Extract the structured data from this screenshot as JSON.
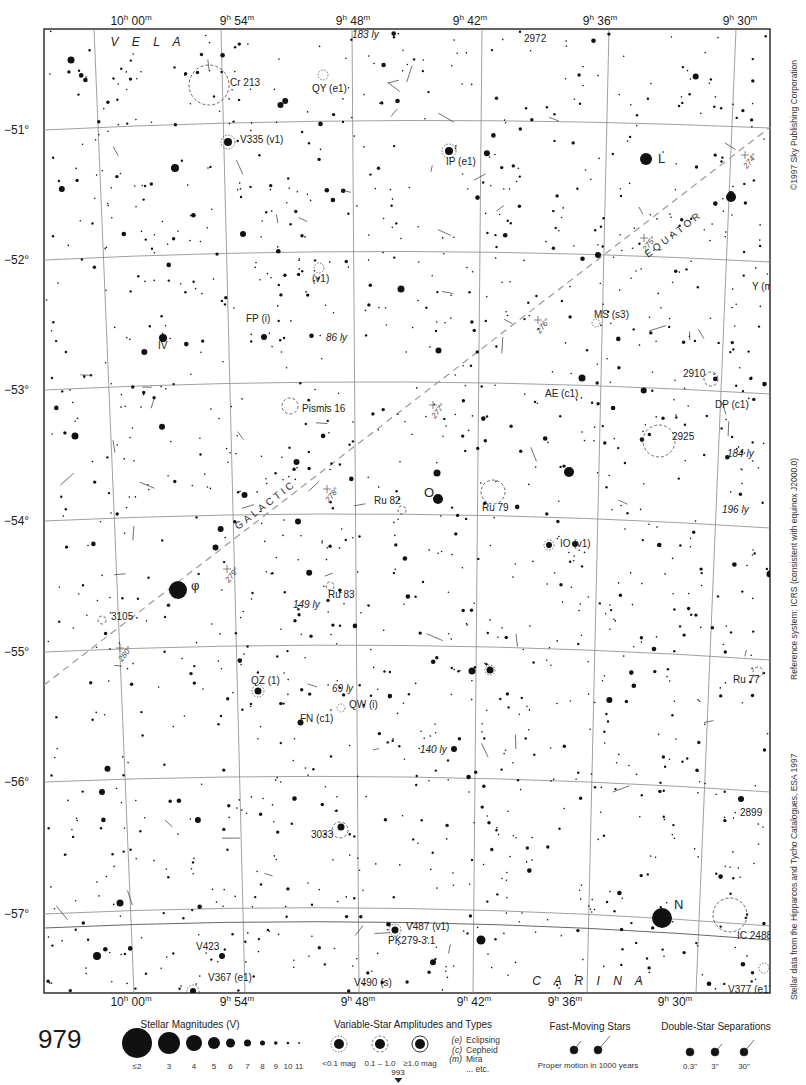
{
  "chart_page": {
    "page_number": "979",
    "adjacent_page_below": "993",
    "copyright": "©1997 Sky Publishing Corporation",
    "reference_system": "Reference system: ICRS (consistent with equinox J2000.0)",
    "data_source": "Stellar data from the Hipparcos and Tycho Catalogues, ESA 1997"
  },
  "axes": {
    "ra_labels": [
      {
        "text": "10h 00m",
        "x_top": 131,
        "x_bot": 131
      },
      {
        "text": "9h 54m",
        "x_top": 237,
        "x_bot": 237
      },
      {
        "text": "9h 48m",
        "x_top": 353,
        "x_bot": 358
      },
      {
        "text": "9h 42m",
        "x_top": 470,
        "x_bot": 474
      },
      {
        "text": "9h 36m",
        "x_top": 600,
        "x_bot": 565
      },
      {
        "text": "9h 30m",
        "x_top": 740,
        "x_bot": 675
      }
    ],
    "dec_labels": [
      {
        "text": "−51°",
        "y": 130
      },
      {
        "text": "−52°",
        "y": 260
      },
      {
        "text": "−53°",
        "y": 390
      },
      {
        "text": "−54°",
        "y": 521
      },
      {
        "text": "−55°",
        "y": 652
      },
      {
        "text": "−56°",
        "y": 782
      },
      {
        "text": "−57°",
        "y": 914
      }
    ]
  },
  "constellations": [
    {
      "name": "V E L A",
      "x": 148,
      "y": 46
    },
    {
      "name": "C A R I N A",
      "x": 590,
      "y": 985
    }
  ],
  "galactic_equator": {
    "label_equator": "EQUATOR",
    "label_galactic": "GALACTIC",
    "ticks": [
      {
        "lon": "274°",
        "x": 745,
        "y": 155
      },
      {
        "lon": "275°",
        "x": 644,
        "y": 238
      },
      {
        "lon": "276°",
        "x": 538,
        "y": 320
      },
      {
        "lon": "277°",
        "x": 433,
        "y": 405
      },
      {
        "lon": "278°",
        "x": 327,
        "y": 489
      },
      {
        "lon": "279°",
        "x": 227,
        "y": 569
      },
      {
        "lon": "280°",
        "x": 120,
        "y": 648
      }
    ]
  },
  "labels": [
    {
      "text": "183 ly",
      "x": 352,
      "y": 38,
      "italic": true
    },
    {
      "text": "2972",
      "x": 524,
      "y": 42
    },
    {
      "text": "Cr 213",
      "x": 230,
      "y": 86
    },
    {
      "text": "QY (e1)",
      "x": 312,
      "y": 92
    },
    {
      "text": "V335 (v1)",
      "x": 240,
      "y": 143
    },
    {
      "text": "IP (e1)",
      "x": 446,
      "y": 165
    },
    {
      "text": "L",
      "x": 658,
      "y": 163
    },
    {
      "text": "(v1)",
      "x": 312,
      "y": 282
    },
    {
      "text": "Y (m3)",
      "x": 752,
      "y": 290
    },
    {
      "text": "FP (i)",
      "x": 246,
      "y": 322
    },
    {
      "text": "MS (s3)",
      "x": 594,
      "y": 318
    },
    {
      "text": "86 ly",
      "x": 326,
      "y": 341,
      "italic": true
    },
    {
      "text": "IV",
      "x": 158,
      "y": 349
    },
    {
      "text": "2910",
      "x": 683,
      "y": 377
    },
    {
      "text": "AE (c1)",
      "x": 545,
      "y": 397
    },
    {
      "text": "Pismis 16",
      "x": 302,
      "y": 412
    },
    {
      "text": "DP (c1)",
      "x": 715,
      "y": 408
    },
    {
      "text": "2925",
      "x": 672,
      "y": 440
    },
    {
      "text": "184 ly",
      "x": 727,
      "y": 457,
      "italic": true
    },
    {
      "text": "O",
      "x": 424,
      "y": 497
    },
    {
      "text": "Ru 82",
      "x": 374,
      "y": 504
    },
    {
      "text": "Ru 79",
      "x": 482,
      "y": 511
    },
    {
      "text": "196 ly",
      "x": 722,
      "y": 513,
      "italic": true
    },
    {
      "text": "IO (v1)",
      "x": 560,
      "y": 547
    },
    {
      "text": "φ",
      "x": 191,
      "y": 590
    },
    {
      "text": "Ru 83",
      "x": 328,
      "y": 598
    },
    {
      "text": "149 ly",
      "x": 293,
      "y": 608,
      "italic": true
    },
    {
      "text": "3105",
      "x": 111,
      "y": 620
    },
    {
      "text": "Ru 77",
      "x": 733,
      "y": 683
    },
    {
      "text": "QZ (1)",
      "x": 251,
      "y": 684
    },
    {
      "text": "69 ly",
      "x": 332,
      "y": 692,
      "italic": true
    },
    {
      "text": "QW (i)",
      "x": 349,
      "y": 708
    },
    {
      "text": "FN (c1)",
      "x": 300,
      "y": 722
    },
    {
      "text": "140 ly",
      "x": 420,
      "y": 753,
      "italic": true
    },
    {
      "text": "2899",
      "x": 740,
      "y": 816
    },
    {
      "text": "3033",
      "x": 311,
      "y": 838
    },
    {
      "text": "N",
      "x": 674,
      "y": 909
    },
    {
      "text": "IC 2488",
      "x": 737,
      "y": 939
    },
    {
      "text": "V487 (v1)",
      "x": 406,
      "y": 930
    },
    {
      "text": "PK279-3.1",
      "x": 388,
      "y": 944
    },
    {
      "text": "V423",
      "x": 196,
      "y": 950
    },
    {
      "text": "V367 (e1)",
      "x": 208,
      "y": 981
    },
    {
      "text": "V490 (s)",
      "x": 354,
      "y": 986
    },
    {
      "text": "V377 (e1)",
      "x": 728,
      "y": 993
    }
  ],
  "legend": {
    "magnitudes": {
      "title": "Stellar Magnitudes (V)",
      "items": [
        {
          "label": "≤2",
          "r": 15
        },
        {
          "label": "3",
          "r": 11
        },
        {
          "label": "4",
          "r": 8
        },
        {
          "label": "5",
          "r": 6
        },
        {
          "label": "6",
          "r": 4.5
        },
        {
          "label": "7",
          "r": 3.5
        },
        {
          "label": "8",
          "r": 2.5
        },
        {
          "label": "9",
          "r": 1.8
        },
        {
          "label": "10",
          "r": 1.3
        },
        {
          "label": "11",
          "r": 0.9
        }
      ]
    },
    "variables": {
      "title": "Variable-Star Amplitudes and Types",
      "amplitudes": [
        "<0.1 mag",
        "0.1 – 1.0",
        "≥1.0 mag"
      ],
      "types": [
        {
          "code": "(e)",
          "name": "Eclipsing"
        },
        {
          "code": "(c)",
          "name": "Cepheid"
        },
        {
          "code": "(m)",
          "name": "Mira"
        },
        {
          "code": "",
          "name": "... etc."
        }
      ]
    },
    "fast_moving": {
      "title": "Fast-Moving Stars",
      "caption": "Proper motion in 1000 years"
    },
    "doubles": {
      "title": "Double-Star Separations",
      "items": [
        "0.3\"",
        "3\"",
        "30\""
      ]
    }
  },
  "named_bright_stars": [
    {
      "x": 178,
      "y": 590,
      "r": 9
    },
    {
      "x": 646,
      "y": 159,
      "r": 6
    },
    {
      "x": 662,
      "y": 918,
      "r": 10
    },
    {
      "x": 438,
      "y": 499,
      "r": 5
    },
    {
      "x": 731,
      "y": 197,
      "r": 5
    },
    {
      "x": 569,
      "y": 472,
      "r": 5
    },
    {
      "x": 163,
      "y": 338,
      "r": 4
    },
    {
      "x": 481,
      "y": 940,
      "r": 4.5
    },
    {
      "x": 97,
      "y": 956,
      "r": 4
    },
    {
      "x": 175,
      "y": 168,
      "r": 4
    },
    {
      "x": 228,
      "y": 142,
      "r": 4
    },
    {
      "x": 449,
      "y": 151,
      "r": 4
    },
    {
      "x": 401,
      "y": 289,
      "r": 3.5
    },
    {
      "x": 582,
      "y": 378,
      "r": 3.5
    },
    {
      "x": 741,
      "y": 799,
      "r": 3
    },
    {
      "x": 258,
      "y": 691,
      "r": 3.5
    },
    {
      "x": 341,
      "y": 827,
      "r": 3.5
    },
    {
      "x": 472,
      "y": 671,
      "r": 3.5
    },
    {
      "x": 120,
      "y": 903,
      "r": 3.5
    },
    {
      "x": 193,
      "y": 991,
      "r": 3
    },
    {
      "x": 395,
      "y": 930,
      "r": 3.5
    },
    {
      "x": 75,
      "y": 436,
      "r": 3.5
    },
    {
      "x": 102,
      "y": 792,
      "r": 3
    },
    {
      "x": 549,
      "y": 545,
      "r": 3
    },
    {
      "x": 490,
      "y": 670,
      "r": 3.5
    },
    {
      "x": 454,
      "y": 749,
      "r": 3
    },
    {
      "x": 437,
      "y": 473,
      "r": 3.5
    },
    {
      "x": 770,
      "y": 574,
      "r": 3.5
    },
    {
      "x": 774,
      "y": 612,
      "r": 3.5
    },
    {
      "x": 222,
      "y": 956,
      "r": 3
    },
    {
      "x": 731,
      "y": 194,
      "r": 3
    },
    {
      "x": 71,
      "y": 60,
      "r": 3.5
    },
    {
      "x": 243,
      "y": 234,
      "r": 3
    },
    {
      "x": 264,
      "y": 337,
      "r": 3
    },
    {
      "x": 598,
      "y": 255,
      "r": 3
    }
  ],
  "clusters": [
    {
      "x": 209,
      "y": 85,
      "r": 20
    },
    {
      "x": 290,
      "y": 406,
      "r": 8
    },
    {
      "x": 659,
      "y": 441,
      "r": 16
    },
    {
      "x": 493,
      "y": 492,
      "r": 12
    },
    {
      "x": 402,
      "y": 510,
      "r": 4
    },
    {
      "x": 330,
      "y": 586,
      "r": 4
    },
    {
      "x": 102,
      "y": 620,
      "r": 4
    },
    {
      "x": 758,
      "y": 672,
      "r": 5
    },
    {
      "x": 711,
      "y": 379,
      "r": 7
    },
    {
      "x": 730,
      "y": 915,
      "r": 17
    },
    {
      "x": 340,
      "y": 830,
      "r": 8
    }
  ]
}
